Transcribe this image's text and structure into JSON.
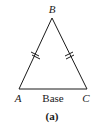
{
  "diagram": {
    "vertices": [
      {
        "name": "A",
        "label": "A"
      },
      {
        "name": "B",
        "label": "B"
      },
      {
        "name": "C",
        "label": "C"
      }
    ],
    "base_label": "Base",
    "caption": "(a)",
    "equal_sides": [
      "AB",
      "BC"
    ],
    "stroke_color": "#1a1a1a"
  }
}
